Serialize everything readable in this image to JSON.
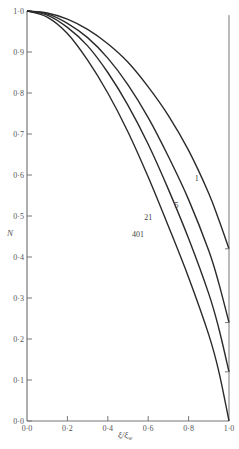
{
  "chart_data": {
    "type": "line",
    "title": "",
    "xlabel": "ξ/ξ_w",
    "ylabel": "N",
    "xlim": [
      0.0,
      1.0
    ],
    "ylim": [
      0.0,
      1.0
    ],
    "grid": false,
    "legend": "inline curve labels",
    "x_ticks": [
      "0·0",
      "0·2",
      "0·4",
      "0·6",
      "0·8",
      "1·0"
    ],
    "y_ticks": [
      "0·0",
      "0·1",
      "0·2",
      "0·3",
      "0·4",
      "0·5",
      "0·6",
      "0·7",
      "0·8",
      "0·9",
      "1·0"
    ],
    "series": [
      {
        "name": "1",
        "x": [
          0.0,
          0.1,
          0.2,
          0.3,
          0.4,
          0.5,
          0.6,
          0.7,
          0.8,
          0.9,
          0.95,
          1.0
        ],
        "y": [
          1.0,
          0.995,
          0.98,
          0.955,
          0.92,
          0.875,
          0.815,
          0.745,
          0.66,
          0.555,
          0.49,
          0.42
        ]
      },
      {
        "name": "5",
        "x": [
          0.0,
          0.1,
          0.2,
          0.3,
          0.4,
          0.5,
          0.6,
          0.7,
          0.8,
          0.9,
          0.95,
          1.0
        ],
        "y": [
          1.0,
          0.993,
          0.97,
          0.935,
          0.885,
          0.82,
          0.74,
          0.645,
          0.54,
          0.415,
          0.335,
          0.24
        ]
      },
      {
        "name": "21",
        "x": [
          0.0,
          0.1,
          0.2,
          0.3,
          0.4,
          0.5,
          0.6,
          0.7,
          0.8,
          0.9,
          0.95,
          1.0
        ],
        "y": [
          1.0,
          0.99,
          0.96,
          0.915,
          0.85,
          0.77,
          0.675,
          0.565,
          0.445,
          0.31,
          0.225,
          0.12
        ]
      },
      {
        "name": "401",
        "x": [
          0.0,
          0.1,
          0.2,
          0.3,
          0.4,
          0.5,
          0.6,
          0.7,
          0.8,
          0.9,
          0.95,
          1.0
        ],
        "y": [
          1.0,
          0.985,
          0.945,
          0.88,
          0.8,
          0.705,
          0.595,
          0.475,
          0.35,
          0.21,
          0.12,
          0.0
        ]
      }
    ],
    "annotations": [
      {
        "text": "1",
        "x": 0.84,
        "y": 0.585
      },
      {
        "text": "5",
        "x": 0.74,
        "y": 0.52
      },
      {
        "text": "21",
        "x": 0.6,
        "y": 0.49
      },
      {
        "text": "401",
        "x": 0.55,
        "y": 0.45
      }
    ],
    "right_reference_line": {
      "x": 1.0,
      "from_y": 0.0,
      "to_y": 0.99
    }
  },
  "labels": {
    "ylabel": "N",
    "xlabel_main": "ξ/ξ",
    "xlabel_sub": "w"
  },
  "colors": {
    "curve": "#2a2a2a",
    "axis": "#777777",
    "text": "#555555"
  }
}
